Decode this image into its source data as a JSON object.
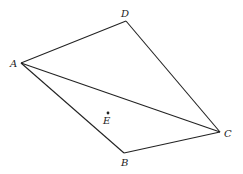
{
  "diagram": {
    "type": "geometry",
    "points": [
      {
        "id": "A",
        "label": "A",
        "x": 21,
        "y": 63,
        "lx": 10,
        "ly": 67
      },
      {
        "id": "D",
        "label": "D",
        "x": 126,
        "y": 21,
        "lx": 121,
        "ly": 17
      },
      {
        "id": "C",
        "label": "C",
        "x": 220,
        "y": 132,
        "lx": 224,
        "ly": 137
      },
      {
        "id": "B",
        "label": "B",
        "x": 124,
        "y": 153,
        "lx": 121,
        "ly": 166
      },
      {
        "id": "E",
        "label": "E",
        "x": 108,
        "y": 113,
        "lx": 103,
        "ly": 124
      }
    ],
    "segments": [
      [
        "A",
        "D"
      ],
      [
        "D",
        "C"
      ],
      [
        "A",
        "C"
      ],
      [
        "A",
        "B"
      ],
      [
        "B",
        "C"
      ]
    ],
    "line_color": "#222222"
  }
}
